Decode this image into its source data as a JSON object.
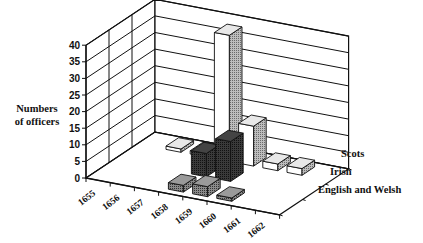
{
  "chart_data": {
    "type": "bar",
    "subtype": "3d-column",
    "title": "",
    "ylabel": "Numbers of officers",
    "ylabel_lines": [
      "Numbers",
      "of officers"
    ],
    "xlabel": "",
    "ylim": [
      0,
      40
    ],
    "yticks": [
      0,
      5,
      10,
      15,
      20,
      25,
      30,
      35,
      40
    ],
    "categories": [
      "1655",
      "1656",
      "1657",
      "1658",
      "1659",
      "1660",
      "1661",
      "1662"
    ],
    "grid": true,
    "legend_position": "right (depth-axis labels)",
    "series": [
      {
        "name": "Scots",
        "values": [
          0,
          1,
          1,
          38,
          12,
          2,
          2,
          0
        ],
        "fill": "white/light"
      },
      {
        "name": "Irish",
        "values": [
          0,
          0,
          0,
          7,
          12,
          0,
          0,
          0
        ],
        "fill": "dark"
      },
      {
        "name": "English and Welsh",
        "values": [
          0,
          0,
          0,
          2,
          3,
          1,
          0,
          0
        ],
        "fill": "medium"
      }
    ]
  },
  "labels": {
    "ylabel_line1": "Numbers",
    "ylabel_line2": "of officers",
    "series_scots": "Scots",
    "series_irish": "Irish",
    "series_english": "English and Welsh"
  }
}
